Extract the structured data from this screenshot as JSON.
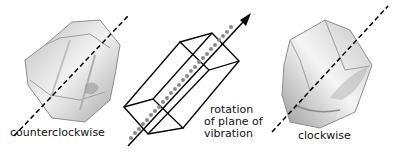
{
  "diagram": {
    "labels": {
      "left_crystal": "counterclockwise",
      "right_crystal": "clockwise",
      "center_line1": "rotation",
      "center_line2": "of plane of",
      "center_line3": "vibration"
    },
    "elements": {
      "left_crystal": "quartz-crystal-image",
      "center": "prism-with-light-ray-arrow",
      "right_crystal": "quartz-crystal-image"
    },
    "colors": {
      "line": "#000000",
      "crystal_shade": "#9a9a9a",
      "helix_marks": "#8a8a8a",
      "background": "#ffffff"
    }
  }
}
